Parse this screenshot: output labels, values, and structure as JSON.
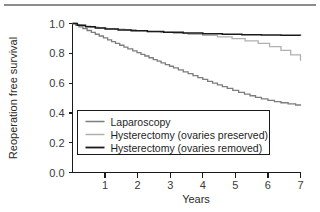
{
  "figure": {
    "has_top_rule": true,
    "background": "#ffffff"
  },
  "chart_data": {
    "type": "line",
    "title": "",
    "subtitle": "",
    "xlabel": "Years",
    "ylabel": "Reoperation free survival",
    "xlim": [
      0,
      7
    ],
    "ylim": [
      0.0,
      1.0
    ],
    "xticks": [
      1,
      2,
      3,
      4,
      5,
      6,
      7
    ],
    "xtick_labels": [
      "1",
      "2",
      "3",
      "4",
      "5",
      "6",
      "7"
    ],
    "yticks": [
      0.0,
      0.2,
      0.4,
      0.6,
      0.8,
      1.0
    ],
    "ytick_labels": [
      "0.0",
      "0.2",
      "0.4",
      "0.6",
      "0.8",
      "1.0"
    ],
    "grid": false,
    "legend_position": "lower-center",
    "step_style": "kaplan-meier",
    "series": [
      {
        "name": "Laparoscopy",
        "color": "#7d7d7d",
        "linewidth": 1.3,
        "x": [
          0.0,
          0.1,
          0.2,
          0.32,
          0.45,
          0.58,
          0.7,
          0.82,
          0.95,
          1.08,
          1.2,
          1.32,
          1.45,
          1.58,
          1.7,
          1.85,
          1.98,
          2.1,
          2.22,
          2.35,
          2.48,
          2.6,
          2.72,
          2.85,
          2.98,
          3.1,
          3.25,
          3.4,
          3.55,
          3.7,
          3.85,
          4.0,
          4.15,
          4.3,
          4.45,
          4.6,
          4.75,
          4.92,
          5.1,
          5.28,
          5.45,
          5.62,
          5.8,
          6.0,
          6.2,
          6.4,
          6.62,
          6.85,
          7.0
        ],
        "y": [
          1.0,
          0.99,
          0.978,
          0.966,
          0.953,
          0.941,
          0.928,
          0.916,
          0.903,
          0.89,
          0.878,
          0.866,
          0.854,
          0.842,
          0.83,
          0.816,
          0.804,
          0.793,
          0.782,
          0.77,
          0.758,
          0.747,
          0.736,
          0.724,
          0.713,
          0.702,
          0.689,
          0.676,
          0.663,
          0.65,
          0.637,
          0.625,
          0.612,
          0.6,
          0.588,
          0.576,
          0.564,
          0.551,
          0.538,
          0.526,
          0.515,
          0.504,
          0.494,
          0.484,
          0.476,
          0.468,
          0.461,
          0.453,
          0.45
        ]
      },
      {
        "name": "Hysterectomy (ovaries preserved)",
        "color": "#b0b0b0",
        "linewidth": 1.3,
        "x": [
          0.0,
          0.12,
          0.3,
          0.55,
          0.8,
          1.05,
          1.3,
          1.6,
          1.95,
          2.3,
          2.7,
          3.1,
          3.55,
          4.0,
          4.45,
          4.9,
          5.3,
          5.7,
          6.05,
          6.4,
          6.7,
          7.0
        ],
        "y": [
          1.0,
          0.99,
          0.982,
          0.975,
          0.97,
          0.966,
          0.962,
          0.958,
          0.952,
          0.946,
          0.94,
          0.934,
          0.928,
          0.92,
          0.91,
          0.898,
          0.884,
          0.866,
          0.845,
          0.82,
          0.79,
          0.75
        ]
      },
      {
        "name": "Hysterectomy (ovaries removed)",
        "color": "#1a1a1a",
        "linewidth": 1.5,
        "x": [
          0.0,
          0.15,
          0.4,
          0.7,
          1.0,
          1.4,
          1.8,
          2.3,
          2.8,
          3.4,
          4.0,
          4.6,
          5.2,
          5.8,
          6.4,
          7.0
        ],
        "y": [
          1.0,
          0.988,
          0.978,
          0.97,
          0.963,
          0.957,
          0.952,
          0.947,
          0.942,
          0.937,
          0.932,
          0.928,
          0.925,
          0.922,
          0.921,
          0.92
        ]
      }
    ]
  },
  "legend": {
    "entries": [
      {
        "label": "Laparoscopy",
        "color": "#7d7d7d"
      },
      {
        "label": "Hysterectomy (ovaries preserved)",
        "color": "#b0b0b0"
      },
      {
        "label": "Hysterectomy (ovaries removed)",
        "color": "#1a1a1a"
      }
    ]
  }
}
